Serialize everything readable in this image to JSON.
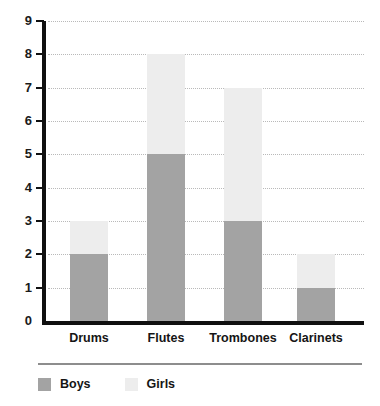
{
  "chart_data": {
    "type": "bar",
    "subtype": "stacked-bar",
    "title": "",
    "xlabel": "",
    "ylabel": "",
    "categories": [
      "Drums",
      "Flutes",
      "Trombones",
      "Clarinets"
    ],
    "series": [
      {
        "name": "Boys",
        "color": "#a3a3a3",
        "values": [
          2,
          5,
          3,
          1
        ]
      },
      {
        "name": "Girls",
        "color": "#ededed",
        "values": [
          1,
          3,
          4,
          1
        ]
      }
    ],
    "totals": [
      3,
      8,
      7,
      2
    ],
    "ylim": [
      0,
      9
    ],
    "ytick_labels": [
      "0",
      "1",
      "2",
      "3",
      "4",
      "5",
      "6",
      "7",
      "8",
      "9"
    ],
    "ytick_values": [
      0,
      1,
      2,
      3,
      4,
      5,
      6,
      7,
      8,
      9
    ],
    "grid": "horizontal-dotted",
    "legend_position": "bottom-left"
  },
  "legend": {
    "items": [
      {
        "label": "Boys",
        "color": "#a3a3a3"
      },
      {
        "label": "Girls",
        "color": "#ededed"
      }
    ]
  },
  "colors": {
    "boys": "#a3a3a3",
    "girls": "#ededed",
    "axis": "#101010",
    "grid": "#b9b9b9",
    "legend_rule": "#8d8d8d",
    "background": "#ffffff"
  }
}
